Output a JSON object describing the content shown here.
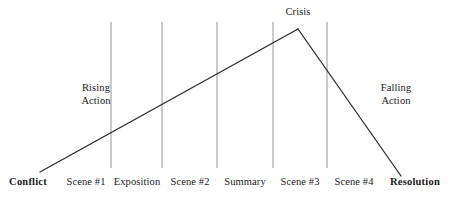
{
  "diagram": {
    "colors": {
      "background": "#ffffff",
      "plot_line": "#2b2b2b",
      "divider_line": "#8a8a8a",
      "text": "#1a1a1a"
    },
    "apex_label": {
      "text": "Crisis",
      "x": 298,
      "y": 6
    },
    "phase_labels": [
      {
        "line1": "Rising",
        "line2": "Action",
        "x": 96,
        "y": 81
      },
      {
        "line1": "Falling",
        "line2": "Action",
        "x": 396,
        "y": 81
      }
    ],
    "stage_labels": [
      {
        "text": "Conflict",
        "x": 28,
        "y": 176,
        "bold": true
      },
      {
        "text": "Scene #1",
        "x": 86,
        "y": 176,
        "bold": false
      },
      {
        "text": "Exposition",
        "x": 137,
        "y": 176,
        "bold": false
      },
      {
        "text": "Scene #2",
        "x": 190,
        "y": 176,
        "bold": false
      },
      {
        "text": "Summary",
        "x": 245,
        "y": 176,
        "bold": false
      },
      {
        "text": "Scene #3",
        "x": 300,
        "y": 176,
        "bold": false
      },
      {
        "text": "Scene #4",
        "x": 354,
        "y": 176,
        "bold": false
      },
      {
        "text": "Resolution",
        "x": 415,
        "y": 176,
        "bold": true
      }
    ],
    "dividers": [
      {
        "x": 111,
        "y_top": 22,
        "y_bottom": 168
      },
      {
        "x": 162,
        "y_top": 22,
        "y_bottom": 168
      },
      {
        "x": 217,
        "y_top": 22,
        "y_bottom": 168
      },
      {
        "x": 273,
        "y_top": 22,
        "y_bottom": 168
      },
      {
        "x": 327,
        "y_top": 22,
        "y_bottom": 168
      }
    ],
    "plot_line": {
      "rising": {
        "x1": 40,
        "y1": 172,
        "x2": 298,
        "y2": 29
      },
      "falling": {
        "x1": 298,
        "y1": 29,
        "x2": 401,
        "y2": 176
      }
    }
  }
}
